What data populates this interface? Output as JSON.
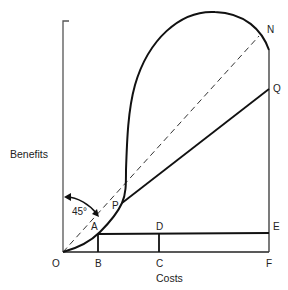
{
  "diagram": {
    "type": "cost-benefit diagram",
    "axes": {
      "x_label": "Costs",
      "y_label": "Benefits"
    },
    "points": {
      "O": "O",
      "A": "A",
      "B": "B",
      "C": "C",
      "D": "D",
      "E": "E",
      "F": "F",
      "P": "P",
      "Q": "Q",
      "N": "N"
    },
    "angle_label": "45°",
    "elements": [
      {
        "name": "45-degree dashed line",
        "from": "O",
        "to": "N",
        "style": "dashed"
      },
      {
        "name": "benefit curve",
        "from": "O",
        "through": [
          "A",
          "P"
        ],
        "to": "N",
        "style": "solid bold"
      },
      {
        "name": "line PQ",
        "from": "P",
        "to": "Q",
        "style": "solid"
      },
      {
        "name": "line AE",
        "from": "A",
        "to": "E",
        "style": "solid"
      },
      {
        "name": "segment AB",
        "from": "A",
        "to": "B",
        "style": "solid"
      },
      {
        "name": "segment DC",
        "from": "D",
        "to": "C",
        "style": "solid"
      },
      {
        "name": "vertical line F to N",
        "from": "F",
        "to": "N",
        "style": "solid"
      }
    ]
  }
}
